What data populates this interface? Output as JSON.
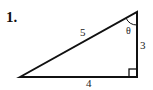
{
  "problem": {
    "number": "1."
  },
  "figure": {
    "type": "right-triangle",
    "vertices": {
      "left": [
        20,
        77
      ],
      "top": [
        137,
        12
      ],
      "right_angle": [
        137,
        77
      ]
    },
    "labels": {
      "hypotenuse": "5",
      "vertical_leg": "3",
      "horizontal_leg": "4",
      "angle": "θ"
    },
    "stroke_color": "#111111"
  }
}
